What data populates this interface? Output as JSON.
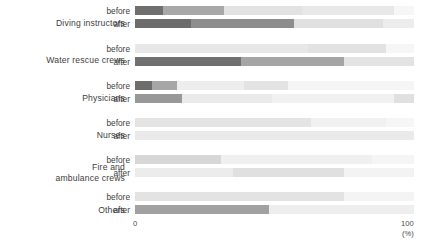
{
  "chart_data": {
    "type": "bar",
    "title": "",
    "subtitle": "",
    "xlabel": "(%)",
    "ylabel": "",
    "xlim": [
      0,
      100
    ],
    "xticks": [
      0,
      100
    ],
    "xtick_labels": [
      "0",
      "100"
    ],
    "grid": false,
    "legend": "none",
    "orientation": "horizontal",
    "stacked": true,
    "categories": [
      "Diving instructors",
      "Water rescue crews",
      "Physicians",
      "Nurses",
      "Fire and\nambulance crews",
      "Others"
    ],
    "subgroups": [
      "before",
      "after"
    ],
    "palette": [
      "#6e6e6e",
      "#9a9a9a",
      "#c4c4c4",
      "#dcdcdc",
      "#eeeeee",
      "#f7f7f7"
    ],
    "series": [
      {
        "name": "segment-1",
        "color": "#6e6e6e"
      },
      {
        "name": "segment-2",
        "color": "#9a9a9a"
      },
      {
        "name": "segment-3",
        "color": "#c4c4c4"
      },
      {
        "name": "segment-4",
        "color": "#dcdcdc"
      },
      {
        "name": "segment-5",
        "color": "#eeeeee"
      },
      {
        "name": "segment-6",
        "color": "#f7f7f7"
      }
    ],
    "rows": [
      {
        "category": "Diving instructors",
        "subgroup": "before",
        "values": [
          10,
          22,
          28,
          33,
          7
        ],
        "colors": [
          "#6f6f6f",
          "#a8a8a8",
          "#e2e2e2",
          "#e8e8e8",
          "#f6f6f6"
        ]
      },
      {
        "category": "Diving instructors",
        "subgroup": "after",
        "values": [
          20,
          37,
          32,
          11
        ],
        "colors": [
          "#6c6c6c",
          "#8d8d8d",
          "#e0e0e0",
          "#ececec"
        ]
      },
      {
        "category": "Water rescue crews",
        "subgroup": "before",
        "values": [
          62,
          28,
          10
        ],
        "colors": [
          "#e7e7e7",
          "#e2e2e2",
          "#f6f6f6"
        ]
      },
      {
        "category": "Water rescue crews",
        "subgroup": "after",
        "values": [
          38,
          37,
          25
        ],
        "colors": [
          "#707070",
          "#a5a5a5",
          "#e3e3e3"
        ]
      },
      {
        "category": "Physicians",
        "subgroup": "before",
        "values": [
          6,
          9,
          24,
          16,
          45
        ],
        "colors": [
          "#6d6d6d",
          "#a6a6a6",
          "#ededed",
          "#e3e3e3",
          "#f5f5f5"
        ]
      },
      {
        "category": "Physicians",
        "subgroup": "after",
        "values": [
          17,
          32,
          44,
          7
        ],
        "colors": [
          "#989898",
          "#eaeaea",
          "#f1f1f1",
          "#e0e0e0"
        ]
      },
      {
        "category": "Nurses",
        "subgroup": "before",
        "values": [
          63,
          27,
          10
        ],
        "colors": [
          "#e4e4e4",
          "#f1f1f1",
          "#f6f6f6"
        ]
      },
      {
        "category": "Nurses",
        "subgroup": "after",
        "values": [
          100
        ],
        "colors": [
          "#eaeaea"
        ]
      },
      {
        "category": "Fire and ambulance crews",
        "subgroup": "before",
        "values": [
          31,
          54,
          15
        ],
        "colors": [
          "#d7d7d7",
          "#f0f0f0",
          "#f5f5f5"
        ]
      },
      {
        "category": "Fire and ambulance crews",
        "subgroup": "after",
        "values": [
          35,
          40,
          25
        ],
        "colors": [
          "#ececec",
          "#e0e0e0",
          "#f3f3f3"
        ]
      },
      {
        "category": "Others",
        "subgroup": "before",
        "values": [
          75,
          25
        ],
        "colors": [
          "#e3e3e3",
          "#f4f4f4"
        ]
      },
      {
        "category": "Others",
        "subgroup": "after",
        "values": [
          48,
          52
        ],
        "colors": [
          "#a1a1a1",
          "#eeeeee"
        ]
      }
    ]
  },
  "axis": {
    "min_label": "0",
    "max_label": "100",
    "unit_label": "(%)"
  },
  "labels": {
    "before": "before",
    "after": "after"
  }
}
